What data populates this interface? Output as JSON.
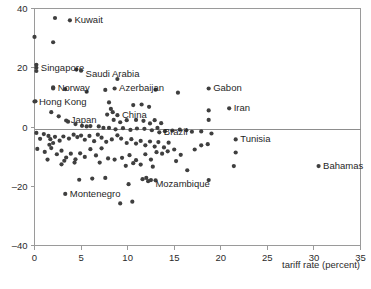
{
  "chart_data": {
    "type": "scatter",
    "title": "",
    "xlabel": "tariff rate (percent)",
    "ylabel": "",
    "xlim": [
      0,
      35
    ],
    "ylim": [
      -40,
      40
    ],
    "xticks": [
      0,
      5,
      10,
      15,
      20,
      25,
      30,
      35
    ],
    "yticks": [
      40,
      20,
      0,
      -20,
      -40
    ],
    "xtick_labels": [
      "0",
      "5",
      "10",
      "15",
      "20",
      "25",
      "30",
      "35"
    ],
    "ytick_labels": [
      "40",
      "20",
      "0",
      "–20",
      "–40"
    ],
    "grid": false,
    "legend": null,
    "reference_lines": [
      {
        "axis": "y",
        "value": 0
      }
    ],
    "marker": {
      "shape": "circle",
      "size": 2.1,
      "color": "#3f3f3f"
    },
    "labeled_points": [
      {
        "label": "Kuwait",
        "x": 3.8,
        "y": 36.0,
        "label_dx": 4.5,
        "label_dy": 3.0
      },
      {
        "label": "Singapore",
        "x": 0.2,
        "y": 20.0,
        "label_dx": 4.5,
        "label_dy": 3.0
      },
      {
        "label": "Saudi Arabia",
        "x": 5.0,
        "y": 19.0,
        "label_dx": 4.5,
        "label_dy": 6.5
      },
      {
        "label": "Norway",
        "x": 2.0,
        "y": 13.0,
        "label_dx": 4.5,
        "label_dy": 3.0
      },
      {
        "label": "Azerbaijan",
        "x": 8.6,
        "y": 13.0,
        "label_dx": 4.5,
        "label_dy": 3.0
      },
      {
        "label": "Gabon",
        "x": 18.7,
        "y": 13.0,
        "label_dx": 4.5,
        "label_dy": 3.0
      },
      {
        "label": "Hong Kong",
        "x": 0.0,
        "y": 8.6,
        "label_dx": 4.5,
        "label_dy": 3.0
      },
      {
        "label": "Iran",
        "x": 20.9,
        "y": 6.3,
        "label_dx": 4.5,
        "label_dy": 3.0
      },
      {
        "label": "China",
        "x": 8.9,
        "y": 4.0,
        "label_dx": 4.5,
        "label_dy": 3.0
      },
      {
        "label": "Japan",
        "x": 3.4,
        "y": 2.2,
        "label_dx": 4.5,
        "label_dy": 3.0
      },
      {
        "label": "Brazil",
        "x": 13.4,
        "y": -1.8,
        "label_dx": 4.5,
        "label_dy": 3.0
      },
      {
        "label": "Tunisia",
        "x": 21.6,
        "y": -4.2,
        "label_dx": 4.5,
        "label_dy": 3.0
      },
      {
        "label": "Bahamas",
        "x": 30.5,
        "y": -13.2,
        "label_dx": 4.5,
        "label_dy": 3.0
      },
      {
        "label": "Mozambique",
        "x": 12.5,
        "y": -17.9,
        "label_dx": 4.5,
        "label_dy": 6.5
      },
      {
        "label": "Montenegro",
        "x": 3.3,
        "y": -22.6,
        "label_dx": 4.5,
        "label_dy": 3.0
      }
    ],
    "unlabeled_points": [
      {
        "x": 2.2,
        "y": 36.8
      },
      {
        "x": 0.0,
        "y": 30.4
      },
      {
        "x": 2.0,
        "y": 28.6
      },
      {
        "x": 0.2,
        "y": 21.0
      },
      {
        "x": 0.2,
        "y": 18.9
      },
      {
        "x": 4.5,
        "y": 19.4
      },
      {
        "x": 8.9,
        "y": 16.2
      },
      {
        "x": 3.3,
        "y": 12.8
      },
      {
        "x": 5.6,
        "y": 11.9
      },
      {
        "x": 7.6,
        "y": 12.5
      },
      {
        "x": 15.4,
        "y": 11.6
      },
      {
        "x": 13.0,
        "y": 12.6
      },
      {
        "x": 2.0,
        "y": 13.4
      },
      {
        "x": 0.1,
        "y": 8.7
      },
      {
        "x": 8.0,
        "y": 8.3
      },
      {
        "x": 10.6,
        "y": 7.4
      },
      {
        "x": 11.5,
        "y": 7.6
      },
      {
        "x": 12.3,
        "y": 6.8
      },
      {
        "x": 18.7,
        "y": 5.6
      },
      {
        "x": 18.7,
        "y": 2.4
      },
      {
        "x": 1.8,
        "y": 5.0
      },
      {
        "x": 2.6,
        "y": 3.6
      },
      {
        "x": 8.2,
        "y": 6.1
      },
      {
        "x": 8.4,
        "y": 5.0
      },
      {
        "x": 7.8,
        "y": 4.2
      },
      {
        "x": 8.5,
        "y": 2.4
      },
      {
        "x": 9.2,
        "y": 1.6
      },
      {
        "x": 9.9,
        "y": 2.3
      },
      {
        "x": 10.9,
        "y": 2.4
      },
      {
        "x": 11.7,
        "y": 2.1
      },
      {
        "x": 12.4,
        "y": 1.2
      },
      {
        "x": 12.9,
        "y": 2.3
      },
      {
        "x": 13.6,
        "y": 1.3
      },
      {
        "x": 3.6,
        "y": 1.8
      },
      {
        "x": 4.4,
        "y": 1.0
      },
      {
        "x": 5.1,
        "y": 0.4
      },
      {
        "x": 5.6,
        "y": 0.2
      },
      {
        "x": 6.0,
        "y": 0.3
      },
      {
        "x": 6.9,
        "y": 0.2
      },
      {
        "x": 7.4,
        "y": -0.3
      },
      {
        "x": 8.0,
        "y": -0.3
      },
      {
        "x": 8.7,
        "y": -0.8
      },
      {
        "x": 9.5,
        "y": -0.4
      },
      {
        "x": 10.3,
        "y": -1.0
      },
      {
        "x": 11.0,
        "y": -0.5
      },
      {
        "x": 11.8,
        "y": -0.6
      },
      {
        "x": 12.6,
        "y": -1.1
      },
      {
        "x": 13.2,
        "y": -0.3
      },
      {
        "x": 14.0,
        "y": -1.4
      },
      {
        "x": 14.8,
        "y": -1.2
      },
      {
        "x": 15.6,
        "y": -0.9
      },
      {
        "x": 16.3,
        "y": -1.1
      },
      {
        "x": 16.9,
        "y": -1.6
      },
      {
        "x": 17.9,
        "y": -1.5
      },
      {
        "x": 19.0,
        "y": -2.2
      },
      {
        "x": 0.2,
        "y": -2.0
      },
      {
        "x": 1.0,
        "y": -2.4
      },
      {
        "x": 1.5,
        "y": -3.0
      },
      {
        "x": 1.7,
        "y": -4.1
      },
      {
        "x": 2.2,
        "y": -3.3
      },
      {
        "x": 2.7,
        "y": -4.6
      },
      {
        "x": 3.1,
        "y": -3.2
      },
      {
        "x": 3.7,
        "y": -3.9
      },
      {
        "x": 4.2,
        "y": -2.6
      },
      {
        "x": 4.6,
        "y": -3.4
      },
      {
        "x": 5.0,
        "y": -2.9
      },
      {
        "x": 5.4,
        "y": -4.3
      },
      {
        "x": 5.9,
        "y": -3.0
      },
      {
        "x": 6.4,
        "y": -4.8
      },
      {
        "x": 6.8,
        "y": -2.6
      },
      {
        "x": 7.2,
        "y": -3.6
      },
      {
        "x": 7.7,
        "y": -5.0
      },
      {
        "x": 8.3,
        "y": -4.2
      },
      {
        "x": 8.9,
        "y": -2.8
      },
      {
        "x": 9.3,
        "y": -3.9
      },
      {
        "x": 9.9,
        "y": -5.4
      },
      {
        "x": 10.4,
        "y": -4.1
      },
      {
        "x": 10.9,
        "y": -5.6
      },
      {
        "x": 11.4,
        "y": -4.7
      },
      {
        "x": 11.9,
        "y": -6.2
      },
      {
        "x": 12.4,
        "y": -4.9
      },
      {
        "x": 12.9,
        "y": -6.6
      },
      {
        "x": 13.3,
        "y": -5.1
      },
      {
        "x": 13.9,
        "y": -6.9
      },
      {
        "x": 14.4,
        "y": -5.3
      },
      {
        "x": 15.0,
        "y": -7.6
      },
      {
        "x": 15.7,
        "y": -9.4
      },
      {
        "x": 16.4,
        "y": -14.6
      },
      {
        "x": 17.2,
        "y": -7.6
      },
      {
        "x": 17.9,
        "y": -6.2
      },
      {
        "x": 18.6,
        "y": -5.8
      },
      {
        "x": 21.6,
        "y": -8.6
      },
      {
        "x": 21.4,
        "y": -13.2
      },
      {
        "x": 0.3,
        "y": -7.4
      },
      {
        "x": 1.1,
        "y": -8.4
      },
      {
        "x": 1.8,
        "y": -7.1
      },
      {
        "x": 2.4,
        "y": -9.2
      },
      {
        "x": 2.9,
        "y": -8.0
      },
      {
        "x": 3.4,
        "y": -10.3
      },
      {
        "x": 3.9,
        "y": -9.0
      },
      {
        "x": 4.4,
        "y": -10.9
      },
      {
        "x": 4.9,
        "y": -8.9
      },
      {
        "x": 5.4,
        "y": -10.1
      },
      {
        "x": 6.0,
        "y": -7.5
      },
      {
        "x": 6.6,
        "y": -9.6
      },
      {
        "x": 7.2,
        "y": -7.2
      },
      {
        "x": 7.9,
        "y": -10.6
      },
      {
        "x": 8.6,
        "y": -11.0
      },
      {
        "x": 9.4,
        "y": -10.4
      },
      {
        "x": 10.2,
        "y": -9.5
      },
      {
        "x": 10.6,
        "y": -12.2
      },
      {
        "x": 10.9,
        "y": -11.2
      },
      {
        "x": 11.4,
        "y": -12.7
      },
      {
        "x": 11.9,
        "y": -9.2
      },
      {
        "x": 12.5,
        "y": -11.0
      },
      {
        "x": 13.1,
        "y": -8.5
      },
      {
        "x": 13.7,
        "y": -9.0
      },
      {
        "x": 14.3,
        "y": -8.2
      },
      {
        "x": 2.9,
        "y": -12.6
      },
      {
        "x": 3.2,
        "y": -11.4
      },
      {
        "x": 4.3,
        "y": -12.0
      },
      {
        "x": 1.6,
        "y": -6.0
      },
      {
        "x": 2.0,
        "y": -5.4
      },
      {
        "x": 4.8,
        "y": -17.8
      },
      {
        "x": 6.2,
        "y": -17.4
      },
      {
        "x": 7.6,
        "y": -17.2
      },
      {
        "x": 10.1,
        "y": -19.3
      },
      {
        "x": 11.6,
        "y": -17.6
      },
      {
        "x": 12.0,
        "y": -17.2
      },
      {
        "x": 12.2,
        "y": -18.3
      },
      {
        "x": 13.0,
        "y": -18.0
      },
      {
        "x": 18.7,
        "y": -17.9
      },
      {
        "x": 9.2,
        "y": -25.8
      },
      {
        "x": 10.5,
        "y": -25.2
      },
      {
        "x": 9.8,
        "y": -13.1
      },
      {
        "x": 12.7,
        "y": -13.4
      },
      {
        "x": 15.2,
        "y": -11.5
      },
      {
        "x": 1.4,
        "y": -11.0
      },
      {
        "x": 0.6,
        "y": -4.0
      },
      {
        "x": 7.0,
        "y": -12.0
      }
    ]
  },
  "axis": {
    "x_title": "tariff rate (percent)"
  }
}
